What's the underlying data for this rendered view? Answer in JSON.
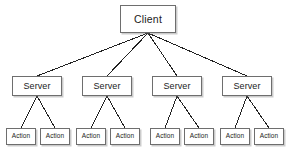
{
  "diagram": {
    "type": "tree",
    "background_color": "#ffffff",
    "box_border_color": "#6e6e6e",
    "box_fill_color": "#ffffff",
    "edge_color": "#222222",
    "text_color": "#1b1b1b",
    "levels": [
      {
        "name": "client-level",
        "nodes": [
          {
            "id": "client",
            "label": "Client",
            "x": 120,
            "y": 5,
            "w": 56,
            "h": 28
          }
        ]
      },
      {
        "name": "server-level",
        "nodes": [
          {
            "id": "server-1",
            "label": "Server",
            "x": 12,
            "y": 76,
            "w": 50,
            "h": 20
          },
          {
            "id": "server-2",
            "label": "Server",
            "x": 82,
            "y": 76,
            "w": 50,
            "h": 20
          },
          {
            "id": "server-3",
            "label": "Server",
            "x": 152,
            "y": 76,
            "w": 50,
            "h": 20
          },
          {
            "id": "server-4",
            "label": "Server",
            "x": 222,
            "y": 76,
            "w": 50,
            "h": 20
          }
        ]
      },
      {
        "name": "action-level",
        "nodes": [
          {
            "id": "action-1",
            "label": "Action",
            "x": 6,
            "y": 128,
            "w": 30,
            "h": 17
          },
          {
            "id": "action-2",
            "label": "Action",
            "x": 40,
            "y": 128,
            "w": 30,
            "h": 17
          },
          {
            "id": "action-3",
            "label": "Action",
            "x": 76,
            "y": 128,
            "w": 30,
            "h": 17
          },
          {
            "id": "action-4",
            "label": "Action",
            "x": 110,
            "y": 128,
            "w": 30,
            "h": 17
          },
          {
            "id": "action-5",
            "label": "Action",
            "x": 150,
            "y": 128,
            "w": 30,
            "h": 17
          },
          {
            "id": "action-6",
            "label": "Action",
            "x": 184,
            "y": 128,
            "w": 30,
            "h": 17
          },
          {
            "id": "action-7",
            "label": "Action",
            "x": 220,
            "y": 128,
            "w": 30,
            "h": 17
          },
          {
            "id": "action-8",
            "label": "Action",
            "x": 254,
            "y": 128,
            "w": 30,
            "h": 17
          }
        ]
      }
    ],
    "edges": [
      {
        "from": "client",
        "to": "server-1",
        "x1": 148,
        "y1": 33,
        "x2": 37,
        "y2": 76
      },
      {
        "from": "client",
        "to": "server-2",
        "x1": 148,
        "y1": 33,
        "x2": 107,
        "y2": 76
      },
      {
        "from": "client",
        "to": "server-3",
        "x1": 148,
        "y1": 33,
        "x2": 177,
        "y2": 76
      },
      {
        "from": "client",
        "to": "server-4",
        "x1": 148,
        "y1": 33,
        "x2": 247,
        "y2": 76
      },
      {
        "from": "server-1",
        "to": "action-1",
        "x1": 37,
        "y1": 96,
        "x2": 21,
        "y2": 128
      },
      {
        "from": "server-1",
        "to": "action-2",
        "x1": 37,
        "y1": 96,
        "x2": 55,
        "y2": 128
      },
      {
        "from": "server-2",
        "to": "action-3",
        "x1": 107,
        "y1": 96,
        "x2": 91,
        "y2": 128
      },
      {
        "from": "server-2",
        "to": "action-4",
        "x1": 107,
        "y1": 96,
        "x2": 125,
        "y2": 128
      },
      {
        "from": "server-3",
        "to": "action-5",
        "x1": 177,
        "y1": 96,
        "x2": 165,
        "y2": 128
      },
      {
        "from": "server-3",
        "to": "action-6",
        "x1": 177,
        "y1": 96,
        "x2": 199,
        "y2": 128
      },
      {
        "from": "server-4",
        "to": "action-7",
        "x1": 247,
        "y1": 96,
        "x2": 235,
        "y2": 128
      },
      {
        "from": "server-4",
        "to": "action-8",
        "x1": 247,
        "y1": 96,
        "x2": 269,
        "y2": 128
      }
    ]
  }
}
